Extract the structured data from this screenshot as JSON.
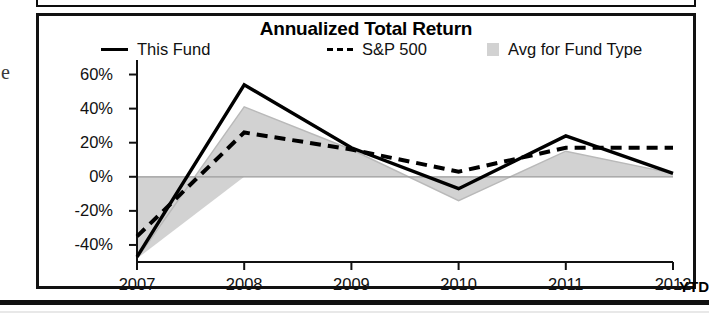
{
  "figure": {
    "title": "Annualized Total Return",
    "margin_glyph": "e"
  },
  "legend": [
    {
      "label": "This Fund",
      "marker": "solid-line-swatch",
      "color": "#000000"
    },
    {
      "label": "S&P 500",
      "marker": "dashed-line-swatch",
      "color": "#000000"
    },
    {
      "label": "Avg for Fund Type",
      "marker": "area-swatch",
      "color": "#d2d2d2"
    }
  ],
  "axis": {
    "y_ticks": [
      "60%",
      "40%",
      "20%",
      "0%",
      "-20%",
      "-40%"
    ],
    "x_ticks": [
      "2007",
      "2008",
      "2009",
      "2010",
      "2011",
      "2012"
    ],
    "ytd_label": "YTD"
  },
  "chart_data": {
    "type": "line",
    "title": "Annualized Total Return",
    "xlabel": "",
    "ylabel": "",
    "categories": [
      "2007",
      "2008",
      "2009",
      "2010",
      "2011",
      "2012"
    ],
    "x_note": "2012 value is YTD",
    "ylim": [
      -50,
      65
    ],
    "y_ticks": [
      60,
      40,
      20,
      0,
      -20,
      -40
    ],
    "y_tick_labels": [
      "60%",
      "40%",
      "20%",
      "0%",
      "-20%",
      "-40%"
    ],
    "grid": false,
    "zero_line": true,
    "legend_position": "top",
    "series": [
      {
        "name": "This Fund",
        "style": "solid",
        "color": "#000000",
        "values": [
          -47,
          54,
          17,
          -7,
          24,
          2
        ]
      },
      {
        "name": "S&P 500",
        "style": "dashed",
        "color": "#000000",
        "values": [
          -35,
          26,
          16,
          3,
          17,
          17
        ]
      },
      {
        "name": "Avg for Fund Type",
        "style": "filled-area",
        "color": "#d2d2d2",
        "values": [
          -48,
          41,
          16,
          -14,
          15,
          2
        ]
      }
    ]
  }
}
